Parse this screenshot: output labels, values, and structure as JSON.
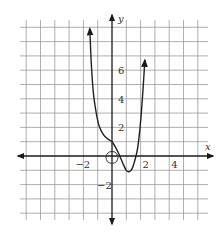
{
  "chart_data": {
    "type": "line",
    "title": "",
    "xlabel": "x",
    "ylabel": "y",
    "xlim": [
      -6,
      6
    ],
    "ylim": [
      -5,
      9
    ],
    "grid": true,
    "grid_step": 1,
    "x_ticks": [
      {
        "value": -2,
        "label": "−2"
      },
      {
        "value": 2,
        "label": "2"
      },
      {
        "value": 4,
        "label": "4"
      }
    ],
    "y_ticks": [
      {
        "value": 6,
        "label": "6"
      },
      {
        "value": 4,
        "label": "4"
      },
      {
        "value": 2,
        "label": "2"
      },
      {
        "value": -2,
        "label": "−2"
      }
    ],
    "series": [
      {
        "name": "f(x)",
        "points": [
          [
            -1.55,
            8.9
          ],
          [
            -1.45,
            6.5
          ],
          [
            -1.3,
            4.4
          ],
          [
            -1.1,
            3.0
          ],
          [
            -0.9,
            2.1
          ],
          [
            -0.6,
            1.5
          ],
          [
            -0.3,
            1.2
          ],
          [
            0.0,
            1.0
          ],
          [
            0.25,
            0.6
          ],
          [
            0.5,
            0.1
          ],
          [
            0.75,
            -0.5
          ],
          [
            1.0,
            -1.0
          ],
          [
            1.2,
            -1.1
          ],
          [
            1.4,
            -0.9
          ],
          [
            1.6,
            -0.3
          ],
          [
            1.8,
            0.6
          ],
          [
            2.0,
            2.4
          ],
          [
            2.15,
            4.4
          ],
          [
            2.3,
            6.7
          ]
        ],
        "arrow_ends": true
      }
    ],
    "annotations": [
      {
        "type": "open-circle",
        "x": 0,
        "y": -0.1,
        "note": "circled point at origin"
      }
    ]
  }
}
